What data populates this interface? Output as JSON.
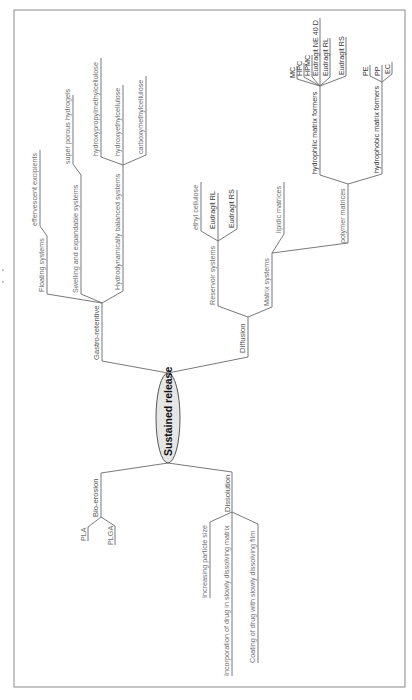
{
  "diagram": {
    "type": "mind-map",
    "orientation": "rotated-90-ccw",
    "root": {
      "label": "Sustained release"
    },
    "branches": [
      {
        "label": "Gastro-retentive",
        "children": [
          {
            "label": "Floating systems",
            "children": [
              {
                "label": "effervescent excipients"
              }
            ]
          },
          {
            "label": "Swelling and expandable systems",
            "children": [
              {
                "label": "super porous hydrogels"
              }
            ]
          },
          {
            "label": "Hydrodynamically balanced systems",
            "children": [
              {
                "label": "hydroxypropylmethylcellulose"
              },
              {
                "label": "hydroxyethylcellulose"
              },
              {
                "label": "carboxymethylcellulose"
              }
            ]
          }
        ]
      },
      {
        "label": "Diffusion",
        "children": [
          {
            "label": "Reservoir systems",
            "children": [
              {
                "label": "ethyl cellulose"
              },
              {
                "label": "Eudragit RL"
              },
              {
                "label": "Eudragit RS"
              }
            ]
          },
          {
            "label": "Matrix systems",
            "children": [
              {
                "label": "lipidic matrices"
              },
              {
                "label": "polymer matrices",
                "children": [
                  {
                    "label": "hydrophilic matrix formers",
                    "children": [
                      {
                        "label": "MC"
                      },
                      {
                        "label": "HPC"
                      },
                      {
                        "label": "HPMC"
                      },
                      {
                        "label": "Eudragit NE 40 D"
                      },
                      {
                        "label": "Eudragit RL"
                      },
                      {
                        "label": "Eudragit RS"
                      }
                    ]
                  },
                  {
                    "label": "hydrophobic matrix formers",
                    "children": [
                      {
                        "label": "PE"
                      },
                      {
                        "label": "PP"
                      },
                      {
                        "label": "EC"
                      }
                    ]
                  }
                ]
              }
            ]
          }
        ]
      },
      {
        "label": "Bio-erosion",
        "children": [
          {
            "label": "PLA"
          },
          {
            "label": "PLGA"
          }
        ]
      },
      {
        "label": "Dissolution",
        "children": [
          {
            "label": "Increasing particle size"
          },
          {
            "label": "Incorporation of drug in slowly dissolving matrix"
          },
          {
            "label": "Coating of drug with slowly dissolving film"
          }
        ]
      }
    ]
  },
  "colors": {
    "line": "#6a6a6a",
    "text": "#6e6e6e",
    "root_fill": "#e6e6e6",
    "frame": "#8a8a8a"
  }
}
